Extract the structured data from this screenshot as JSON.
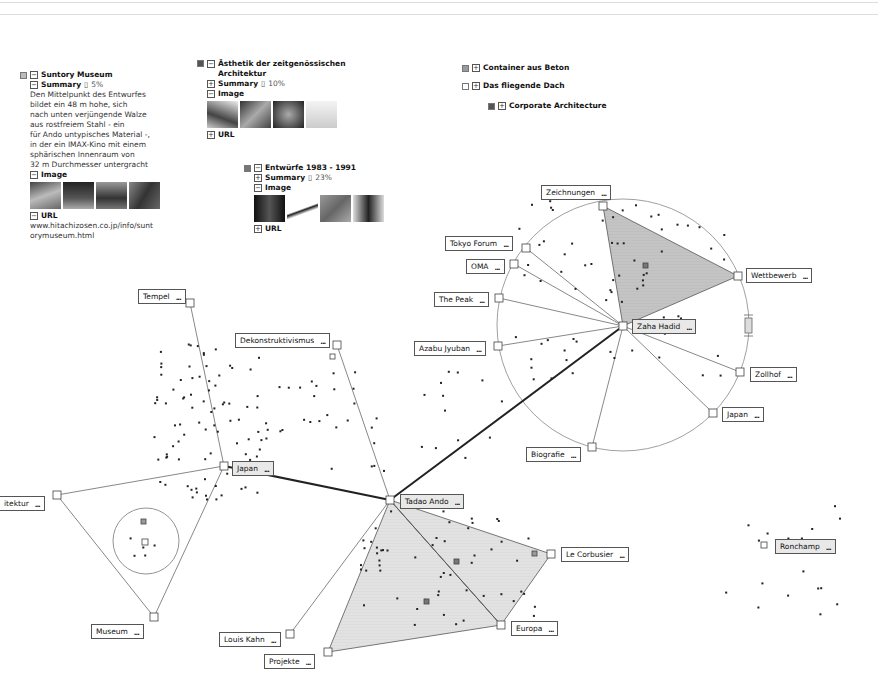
{
  "colors": {
    "accent_dark": "#555555",
    "fill_gray": "#bdbdbd",
    "fill_light": "#dcdcdc",
    "edge": "#444444"
  },
  "panels": [
    {
      "title": "Suntory Museum",
      "summary_label": "Summary",
      "summary_pct": "5%",
      "summary_text": [
        "Den Mittelpunkt des Entwurfes",
        "bildet ein 48 m hohe, sich",
        "nach unten verjüngende Walze",
        "aus rostfreiem Stahl - ein",
        "für Ando untypisches Material -,",
        "in der ein IMAX-Kino mit einem",
        "sphärischen Innenraum von",
        "32 m Durchmesser untergracht"
      ],
      "image_label": "Image",
      "url_label": "URL",
      "url_text": [
        "www.hitachizosen.co.jp/info/sunt",
        "orymuseum.html"
      ]
    },
    {
      "title": "Ästhetik der zeitgenössischen Architektur",
      "summary_label": "Summary",
      "summary_pct": "10%",
      "image_label": "Image",
      "url_label": "URL"
    },
    {
      "title": "Entwürfe 1983 - 1991",
      "summary_label": "Summary",
      "summary_pct": "23%",
      "image_label": "Image",
      "url_label": "URL"
    }
  ],
  "collapsed_items": [
    {
      "label": "Container aus Beton",
      "swatch": "#9a9a9a"
    },
    {
      "label": "Das fliegende Dach",
      "swatch": "#ffffff"
    },
    {
      "label": "Corporate Architecture",
      "swatch": "#555555"
    }
  ],
  "nodes": {
    "zeichnungen": "Zeichnungen",
    "tokyo_forum": "Tokyo Forum",
    "oma": "OMA",
    "the_peak": "The Peak",
    "azabu": "Azabu Jyuban",
    "zaha": "Zaha Hadid",
    "wettbewerb": "Wettbewerb",
    "zollhof": "Zollhof",
    "japan_right": "Japan",
    "biografie": "Biografie",
    "tempel": "Tempel",
    "dekonstruktivismus": "Dekonstruktivismus",
    "japan_left": "Japan",
    "architektur": "itektur",
    "museum": "Museum",
    "tadao": "Tadao Ando",
    "le_corbusier": "Le Corbusier",
    "europa": "Europa",
    "louis_kahn": "Louis Kahn",
    "projekte": "Projekte",
    "ronchamp": "Ronchamp"
  },
  "more_glyph": "..."
}
